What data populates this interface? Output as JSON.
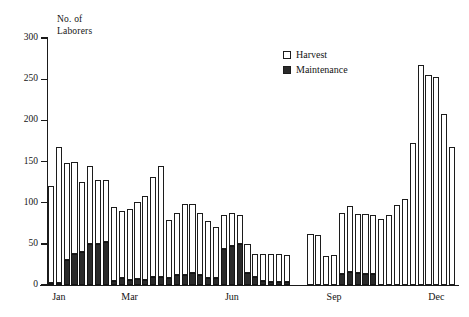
{
  "chart_data": {
    "type": "bar",
    "title": "",
    "ylabel": "No. of Laborers",
    "ylabel_lines": [
      "No. of",
      "Laborers"
    ],
    "xlabel": "",
    "ylim": [
      0,
      300
    ],
    "yticks": [
      0,
      50,
      100,
      150,
      200,
      250,
      300
    ],
    "ytick_labels": [
      "0",
      "50",
      "100",
      "150",
      "200",
      "250",
      "300"
    ],
    "grid": false,
    "stacked": true,
    "legend_position": "upper center-right",
    "legend": [
      "Harvest",
      "Maintenance"
    ],
    "xtick_labels": [
      "Jan",
      "Mar",
      "Jun",
      "Sep",
      "Dec"
    ],
    "xtick_positions": [
      1,
      10,
      23,
      36,
      49
    ],
    "categories": [
      "w1",
      "w2",
      "w3",
      "w4",
      "w5",
      "w6",
      "w7",
      "w8",
      "w9",
      "w10",
      "w11",
      "w12",
      "w13",
      "w14",
      "w15",
      "w16",
      "w17",
      "w18",
      "w19",
      "w20",
      "w21",
      "w22",
      "w23",
      "w24",
      "w25",
      "w26",
      "w27",
      "w28",
      "w29",
      "w30",
      "w31",
      "w32",
      "w33",
      "w34",
      "w35",
      "w36",
      "w37",
      "w38",
      "w39",
      "w40",
      "w41",
      "w42",
      "w43",
      "w44",
      "w45",
      "w46",
      "w47",
      "w48",
      "w49",
      "w50",
      "w51",
      "w52"
    ],
    "series": [
      {
        "name": "Maintenance",
        "color": "#2a2a2a",
        "values": [
          2,
          2,
          30,
          38,
          40,
          50,
          50,
          52,
          5,
          8,
          6,
          7,
          6,
          10,
          10,
          9,
          12,
          12,
          14,
          12,
          8,
          9,
          44,
          47,
          50,
          15,
          10,
          5,
          4,
          4,
          4,
          0,
          0,
          0,
          0,
          0,
          0,
          13,
          16,
          14,
          13,
          13,
          0,
          0,
          0,
          0,
          0,
          0,
          0,
          0,
          0,
          0
        ]
      },
      {
        "name": "Harvest",
        "color": "#ffffff",
        "values": [
          118,
          166,
          118,
          111,
          85,
          95,
          77,
          75,
          90,
          82,
          86,
          94,
          102,
          121,
          135,
          70,
          75,
          86,
          84,
          76,
          70,
          62,
          41,
          41,
          35,
          35,
          28,
          33,
          34,
          34,
          32,
          0,
          0,
          62,
          61,
          35,
          36,
          74,
          80,
          72,
          73,
          72,
          80,
          85,
          97,
          105,
          172,
          267,
          255,
          253,
          208,
          168
        ]
      }
    ],
    "totals": [
      120,
      168,
      148,
      149,
      125,
      145,
      127,
      127,
      95,
      90,
      92,
      101,
      108,
      131,
      145,
      79,
      87,
      98,
      98,
      88,
      78,
      71,
      85,
      88,
      85,
      50,
      38,
      38,
      38,
      38,
      36,
      0,
      0,
      62,
      61,
      35,
      36,
      87,
      96,
      86,
      86,
      85,
      80,
      85,
      97,
      105,
      172,
      267,
      255,
      253,
      208,
      168
    ]
  }
}
